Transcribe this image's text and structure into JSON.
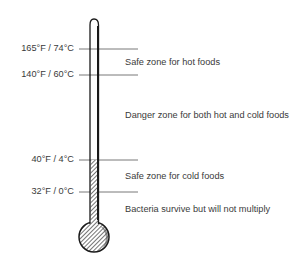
{
  "diagram": {
    "type": "thermometer-food-safety",
    "markers": [
      {
        "label": "165°F / 74°C",
        "fahrenheit": 165,
        "celsius": 74,
        "y": 49
      },
      {
        "label": "140°F / 60°C",
        "fahrenheit": 140,
        "celsius": 60,
        "y": 75
      },
      {
        "label": "40°F / 4°C",
        "fahrenheit": 40,
        "celsius": 4,
        "y": 160
      },
      {
        "label": "32°F / 0°C",
        "fahrenheit": 32,
        "celsius": 0,
        "y": 192
      }
    ],
    "zones": [
      {
        "label": "Safe zone for hot foods"
      },
      {
        "label": "Danger zone for both hot and cold foods"
      },
      {
        "label": "Safe zone for cold foods"
      },
      {
        "label": "Bacteria survive but will not multiply"
      }
    ],
    "colors": {
      "line": "#555555",
      "outline": "#1a1a1a",
      "text": "#3a3a3a"
    }
  }
}
